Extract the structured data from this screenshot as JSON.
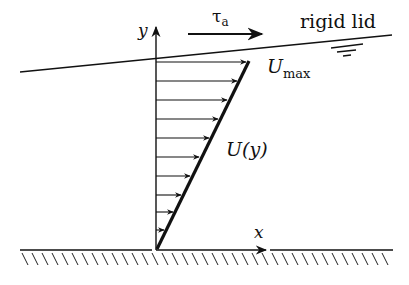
{
  "diagram": {
    "labels": {
      "y_axis": "y",
      "x_axis": "x",
      "stress": "τ",
      "stress_sub": "a",
      "lid": "rigid lid",
      "umax": "U",
      "umax_sub": "max",
      "profile": "U(y)"
    },
    "colors": {
      "ink": "#111111",
      "background": "#ffffff"
    },
    "profile_arrows": 10
  }
}
